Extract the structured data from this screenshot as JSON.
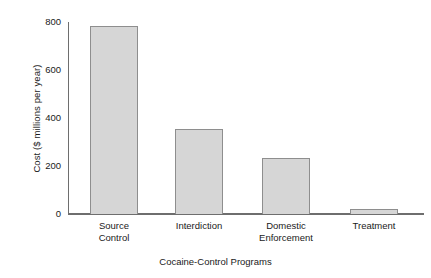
{
  "chart_data": {
    "type": "bar",
    "title": "",
    "subtitle": "",
    "xlabel": "Cocaine-Control Programs",
    "ylabel": "Cost ($ millions per year)",
    "categories": [
      "Source Control",
      "Interdiction",
      "Domestic Enforcement",
      "Treatment"
    ],
    "category_lines": [
      [
        "Source",
        "Control"
      ],
      [
        "Interdiction",
        ""
      ],
      [
        "Domestic",
        "Enforcement"
      ],
      [
        "Treatment",
        ""
      ]
    ],
    "values": [
      783,
      354,
      233,
      21
    ],
    "ylim": [
      0,
      800
    ],
    "yticks": [
      0,
      200,
      400,
      600,
      800
    ],
    "ytick_labels": [
      "0",
      "200",
      "400",
      "600",
      "800"
    ],
    "grid": false,
    "legend": "none",
    "annotations": [],
    "colors": {
      "bar_fill": "#d6d6d6",
      "bar_border": "#8e8e8e",
      "axis": "#6e6e6e",
      "text": "#1a1a1a",
      "background": "#ffffff"
    }
  }
}
